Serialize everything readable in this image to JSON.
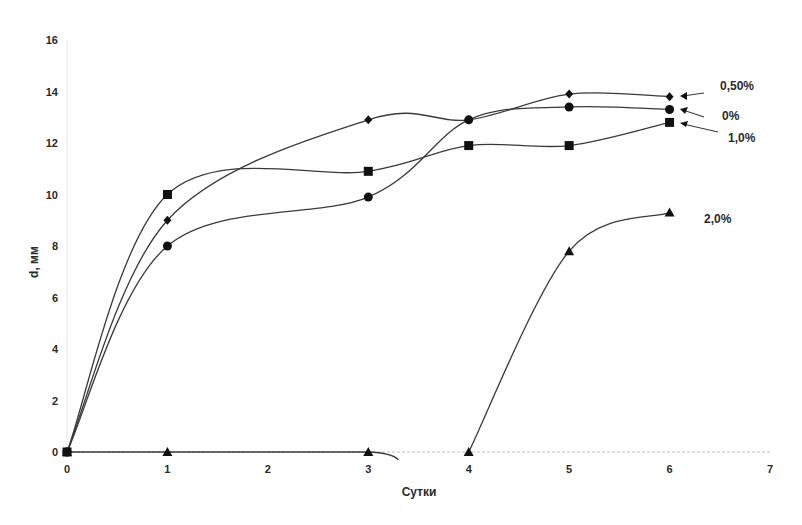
{
  "chart_data": {
    "type": "line",
    "title": "",
    "xlabel": "Сутки",
    "ylabel": "d, мм",
    "xlim": [
      0,
      7
    ],
    "ylim": [
      0,
      16
    ],
    "x_ticks": [
      "0",
      "1",
      "2",
      "3",
      "4",
      "5",
      "6",
      "7"
    ],
    "y_ticks": [
      "0",
      "2",
      "4",
      "6",
      "8",
      "10",
      "12",
      "14",
      "16"
    ],
    "grid": false,
    "legend_position": "inline-right",
    "smooth": true,
    "series": [
      {
        "name": "0,50%",
        "marker": "diamond",
        "x": [
          0,
          1,
          3,
          4,
          5,
          6
        ],
        "values": [
          0,
          9.0,
          12.9,
          12.9,
          13.9,
          13.8
        ]
      },
      {
        "name": "0%",
        "marker": "circle",
        "x": [
          0,
          1,
          3,
          4,
          5,
          6
        ],
        "values": [
          0,
          8.0,
          9.9,
          12.9,
          13.4,
          13.3
        ]
      },
      {
        "name": "1,0%",
        "marker": "square",
        "x": [
          0,
          1,
          3,
          4,
          5,
          6
        ],
        "values": [
          0,
          10.0,
          10.9,
          11.9,
          11.9,
          12.8
        ]
      },
      {
        "name": "2,0%",
        "marker": "triangle",
        "x": [
          0,
          1,
          3,
          4,
          5,
          6
        ],
        "values": [
          0,
          0,
          0,
          0,
          7.8,
          9.3
        ]
      }
    ]
  },
  "labels": {
    "xlabel": "Сутки",
    "ylabel": "d, мм",
    "series_050": "0,50%",
    "series_0": "0%",
    "series_10": "1,0%",
    "series_20": "2,0%"
  }
}
